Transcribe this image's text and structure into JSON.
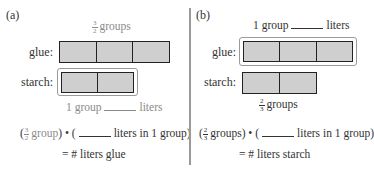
{
  "panel_a": {
    "label": "(a)",
    "top_label": {
      "num": "3",
      "den": "2",
      "text": "groups"
    },
    "glue_label": "glue:",
    "starch_label": "starch:",
    "glue_segments": 3,
    "starch_segments": 2,
    "bottom_label": {
      "left": "1 group",
      "right": "liters"
    },
    "equation": {
      "open": "(",
      "frac_num": "3",
      "frac_den": "2",
      "frac_text": "group",
      "middle": ") • (",
      "rest": "liters in 1 group)",
      "line2": "= # liters glue"
    }
  },
  "panel_b": {
    "label": "(b)",
    "top_label": {
      "left": "1 group",
      "right": "liters"
    },
    "glue_label": "glue:",
    "starch_label": "starch:",
    "glue_segments": 3,
    "starch_segments": 2,
    "bottom_label": {
      "num": "2",
      "den": "3",
      "text": "groups"
    },
    "equation": {
      "open": "(",
      "frac_num": "2",
      "frac_den": "3",
      "frac_text": "groups",
      "middle": ") • (",
      "rest": "liters in 1 group)",
      "line2": "= # liters starch"
    }
  },
  "colors": {
    "bar_fill": "#cfcfcf",
    "bar_stroke": "#222222",
    "outline": "#9a9a9a",
    "gray_text": "#8a8a8a"
  }
}
